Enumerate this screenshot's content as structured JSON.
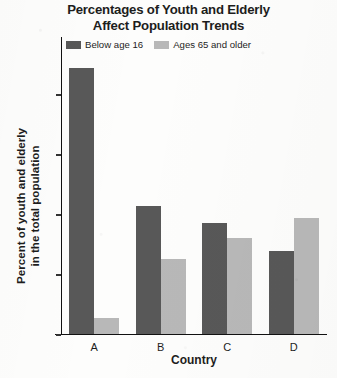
{
  "chart_data": {
    "type": "bar",
    "title": "Percentages of Youth and Elderly Affect Population Trends",
    "title_line1": "Percentages of Youth and Elderly",
    "title_line2": "Affect Population Trends",
    "xlabel": "Country",
    "ylabel": "Percent of youth and elderly in the total population",
    "ylabel_line1": "Percent of youth and elderly",
    "ylabel_line2": "in the total population",
    "categories": [
      "A",
      "B",
      "C",
      "D"
    ],
    "ylim": [
      0,
      46
    ],
    "yticks": [
      0,
      10,
      20,
      30,
      40
    ],
    "grid": false,
    "legend_position": "top",
    "series": [
      {
        "name": "Below age 16",
        "color": "#585858",
        "values": [
          44.3,
          21.2,
          18.5,
          13.7
        ]
      },
      {
        "name": "Ages 65 and older",
        "color": "#b8b8b8",
        "values": [
          2.6,
          12.4,
          16.0,
          19.2
        ]
      }
    ]
  }
}
